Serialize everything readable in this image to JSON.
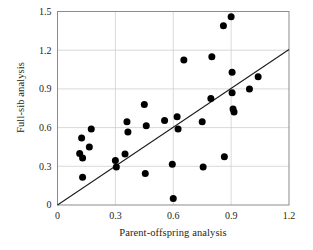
{
  "chart_data": {
    "type": "scatter",
    "title": "",
    "xlabel": "Parent-offspring analysis",
    "ylabel": "Full-sib analysis",
    "xlim": [
      0,
      1.2
    ],
    "ylim": [
      0,
      1.5
    ],
    "xticks": [
      0,
      0.3,
      0.6,
      0.9,
      1.2
    ],
    "xticklabels": [
      "0",
      "0.3",
      "0.6",
      "0.9",
      "1.2"
    ],
    "yticks": [
      0,
      0.3,
      0.6,
      0.9,
      1.2,
      1.5
    ],
    "yticklabels": [
      "0",
      "0.3",
      "0.6",
      "0.9",
      "1.2",
      "1.5"
    ],
    "grid": "both-major-light",
    "legend": "none",
    "marker": {
      "shape": "circle",
      "color": "#000000",
      "size_px": 7
    },
    "points": [
      {
        "x": 0.115,
        "y": 0.4
      },
      {
        "x": 0.125,
        "y": 0.52
      },
      {
        "x": 0.13,
        "y": 0.365
      },
      {
        "x": 0.13,
        "y": 0.215
      },
      {
        "x": 0.165,
        "y": 0.45
      },
      {
        "x": 0.175,
        "y": 0.59
      },
      {
        "x": 0.3,
        "y": 0.345
      },
      {
        "x": 0.305,
        "y": 0.295
      },
      {
        "x": 0.35,
        "y": 0.395
      },
      {
        "x": 0.36,
        "y": 0.645
      },
      {
        "x": 0.365,
        "y": 0.565
      },
      {
        "x": 0.45,
        "y": 0.78
      },
      {
        "x": 0.455,
        "y": 0.245
      },
      {
        "x": 0.46,
        "y": 0.615
      },
      {
        "x": 0.555,
        "y": 0.655
      },
      {
        "x": 0.595,
        "y": 0.315
      },
      {
        "x": 0.6,
        "y": 0.05
      },
      {
        "x": 0.62,
        "y": 0.685
      },
      {
        "x": 0.625,
        "y": 0.59
      },
      {
        "x": 0.655,
        "y": 1.125
      },
      {
        "x": 0.75,
        "y": 0.645
      },
      {
        "x": 0.755,
        "y": 0.295
      },
      {
        "x": 0.795,
        "y": 0.825
      },
      {
        "x": 0.8,
        "y": 1.15
      },
      {
        "x": 0.86,
        "y": 1.39
      },
      {
        "x": 0.865,
        "y": 0.375
      },
      {
        "x": 0.9,
        "y": 1.46
      },
      {
        "x": 0.905,
        "y": 1.03
      },
      {
        "x": 0.905,
        "y": 0.87
      },
      {
        "x": 0.91,
        "y": 0.745
      },
      {
        "x": 0.915,
        "y": 0.72
      },
      {
        "x": 0.995,
        "y": 0.9
      },
      {
        "x": 1.04,
        "y": 0.995
      }
    ],
    "reference_line": {
      "label": "regression-line",
      "from": {
        "x": 0.0,
        "y": 0.0
      },
      "to": {
        "x": 1.2,
        "y": 1.205
      },
      "color": "#1a1a1a"
    }
  }
}
